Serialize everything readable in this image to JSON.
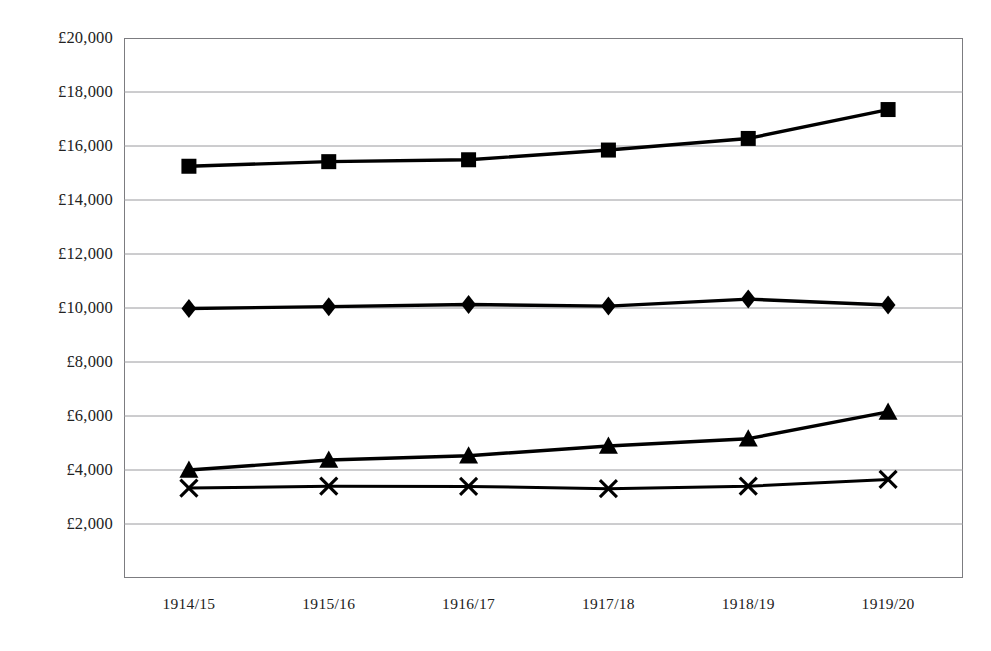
{
  "chart_data": {
    "type": "line",
    "title": "",
    "title_remnant": "",
    "xlabel": "",
    "ylabel": "",
    "grid": true,
    "legend_position": "none",
    "currency_symbol": "£",
    "categories": [
      "1914/15",
      "1915/16",
      "1916/17",
      "1917/18",
      "1918/19",
      "1919/20"
    ],
    "ylim": [
      0,
      20000
    ],
    "ytick_step": 2000,
    "ytick_labels": [
      "£20,000",
      "£18,000",
      "£16,000",
      "£14,000",
      "£12,000",
      "£10,000",
      "£8,000",
      "£6,000",
      "£4,000",
      "£2,000"
    ],
    "ytick_values": [
      20000,
      18000,
      16000,
      14000,
      12000,
      10000,
      8000,
      6000,
      4000,
      2000
    ],
    "series": [
      {
        "name": "series-square",
        "marker": "square",
        "color": "#000000",
        "values": [
          15250,
          15420,
          15490,
          15850,
          16280,
          17350
        ]
      },
      {
        "name": "series-diamond",
        "marker": "diamond",
        "color": "#000000",
        "values": [
          9980,
          10050,
          10130,
          10070,
          10330,
          10110
        ]
      },
      {
        "name": "series-triangle",
        "marker": "triangle",
        "color": "#000000",
        "values": [
          4000,
          4370,
          4530,
          4890,
          5160,
          6150
        ]
      },
      {
        "name": "series-cross",
        "marker": "cross",
        "color": "#000000",
        "values": [
          3330,
          3400,
          3390,
          3310,
          3400,
          3650
        ]
      }
    ]
  }
}
